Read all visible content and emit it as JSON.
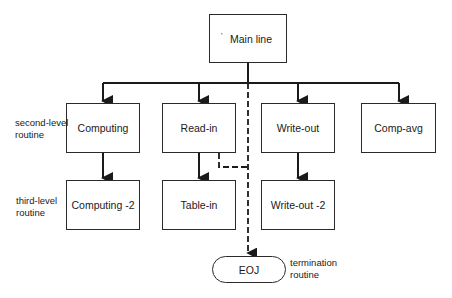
{
  "nodes": {
    "main": {
      "label": "Main line",
      "mark": "'"
    },
    "computing": {
      "label": "Computing"
    },
    "read_in": {
      "label": "Read-in"
    },
    "write_out": {
      "label": "Write-out"
    },
    "comp_avg": {
      "label": "Comp-avg"
    },
    "computing2": {
      "label": "Computing -2"
    },
    "table_in": {
      "label": "Table-in"
    },
    "write_out2": {
      "label": "Write-out -2"
    },
    "eoj": {
      "label": "EOJ"
    }
  },
  "level_labels": {
    "second": [
      "second-level",
      "routine"
    ],
    "third": [
      "third-level",
      "routine"
    ],
    "termination": [
      "termination",
      "routine"
    ]
  },
  "colors": {
    "line": "#1a1a1a",
    "background": "#ffffff"
  }
}
